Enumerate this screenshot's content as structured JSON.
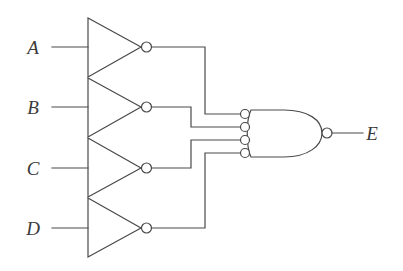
{
  "figure": {
    "kind": "logic-circuit-diagram",
    "background_color": "#ffffff",
    "line_color": "#4a4a4a",
    "label_color": "#3b3b3b",
    "width": 403,
    "height": 271
  },
  "inputs": [
    {
      "label": "A",
      "label_x": 33,
      "label_y": 54,
      "wire_y": 47
    },
    {
      "label": "B",
      "label_x": 33,
      "label_y": 114,
      "wire_y": 107
    },
    {
      "label": "C",
      "label_x": 33,
      "label_y": 175,
      "wire_y": 168
    },
    {
      "label": "D",
      "label_x": 33,
      "label_y": 235,
      "wire_y": 228
    }
  ],
  "output": {
    "label": "E",
    "label_x": 372,
    "label_y": 140,
    "wire_y": 133
  },
  "inverters": [
    {
      "name": "inverter-a",
      "input_label": "A",
      "top": 18,
      "bottom": 77,
      "left": 88,
      "apex": 141,
      "bubble_cx": 146.5,
      "bubble_cy": 47,
      "bubble_r": 5
    },
    {
      "name": "inverter-b",
      "input_label": "B",
      "top": 78,
      "bottom": 137,
      "left": 88,
      "apex": 141,
      "bubble_cx": 146.5,
      "bubble_cy": 107,
      "bubble_r": 5
    },
    {
      "name": "inverter-c",
      "input_label": "C",
      "top": 138,
      "bottom": 197,
      "left": 88,
      "apex": 141,
      "bubble_cx": 146.5,
      "bubble_cy": 168,
      "bubble_r": 5
    },
    {
      "name": "inverter-d",
      "input_label": "D",
      "top": 198,
      "bottom": 257,
      "left": 88,
      "apex": 141,
      "bubble_cx": 146.5,
      "bubble_cy": 228,
      "bubble_r": 5
    }
  ],
  "gate": {
    "name": "and-gate-inverted-inputs",
    "type": "AND",
    "inputs_inverted": true,
    "output_inverted": true,
    "input_count": 4,
    "body_left": 251,
    "body_right": 322,
    "body_top": 110,
    "body_bottom": 157,
    "input_bubbles": [
      {
        "source": "A",
        "cx": 245,
        "cy": 114,
        "r": 4.5
      },
      {
        "source": "B",
        "cx": 245,
        "cy": 127,
        "r": 4.5
      },
      {
        "source": "C",
        "cx": 245,
        "cy": 140,
        "r": 4.5
      },
      {
        "source": "D",
        "cx": 245,
        "cy": 153,
        "r": 4.5
      }
    ],
    "output_bubble": {
      "cx": 327,
      "cy": 133,
      "r": 5
    }
  },
  "routing": {
    "input_stub_x_start": 52,
    "input_stub_x_end": 88,
    "vertical_bus_inner_x": 191,
    "vertical_bus_outer_x": 205,
    "gate_input_x": 240,
    "output_wire_x_end": 363
  }
}
